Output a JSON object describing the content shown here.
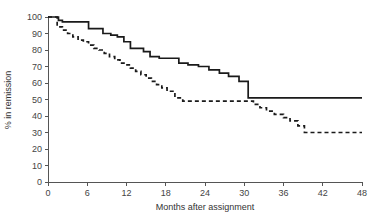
{
  "chart_data": {
    "type": "line",
    "title": "",
    "subtitle": "",
    "xlabel": "Months after assignment",
    "ylabel": "% in remission",
    "xlim": [
      0,
      48
    ],
    "ylim": [
      0,
      100
    ],
    "xticks": [
      0,
      6,
      12,
      18,
      24,
      30,
      36,
      42,
      48
    ],
    "xtick_labels": [
      "0",
      "6",
      "12",
      "18",
      "24",
      "30",
      "36",
      "42",
      "48"
    ],
    "yticks": [
      0,
      10,
      20,
      30,
      40,
      50,
      60,
      70,
      80,
      90,
      100
    ],
    "ytick_labels": [
      "0",
      "10",
      "20",
      "30",
      "40",
      "50",
      "60",
      "70",
      "80",
      "90",
      "100"
    ],
    "grid": false,
    "legend": "none",
    "step_type": "post",
    "series": [
      {
        "name": "solid-curve",
        "style": "solid",
        "color": "#1a1a1a",
        "x": [
          0,
          1.0,
          1.6,
          2.2,
          3.0,
          5.0,
          6.2,
          7.0,
          8.4,
          9.6,
          10.6,
          11.6,
          12.6,
          13.6,
          14.6,
          15.6,
          17.0,
          18.6,
          20.0,
          21.4,
          23.0,
          24.6,
          26.2,
          27.6,
          29.2,
          30.6,
          48
        ],
        "y": [
          100,
          100,
          98,
          97,
          97,
          97,
          93,
          93,
          90,
          89,
          88,
          85,
          81,
          81,
          79,
          76,
          75,
          75,
          72,
          71,
          70,
          68,
          66,
          64,
          61,
          51,
          51
        ]
      },
      {
        "name": "dashed-curve",
        "style": "dashed",
        "color": "#1a1a1a",
        "x": [
          0,
          0.6,
          1.4,
          2.2,
          3.0,
          3.8,
          4.6,
          5.4,
          6.2,
          7.0,
          7.8,
          8.6,
          9.4,
          10.2,
          11.0,
          11.8,
          12.6,
          13.4,
          14.2,
          15.0,
          15.8,
          16.6,
          17.4,
          18.2,
          19.4,
          20.6,
          30.4,
          31.4,
          32.4,
          33.4,
          34.6,
          36.0,
          37.0,
          38.2,
          39.2,
          48
        ],
        "y": [
          100,
          100,
          94,
          92,
          90,
          88,
          86,
          85,
          83,
          81,
          80,
          78,
          76,
          74,
          72,
          71,
          69,
          67,
          65,
          63,
          61,
          59,
          57,
          55,
          51,
          49,
          49,
          47,
          45,
          43,
          41,
          39,
          37,
          34,
          30,
          30
        ]
      }
    ]
  }
}
